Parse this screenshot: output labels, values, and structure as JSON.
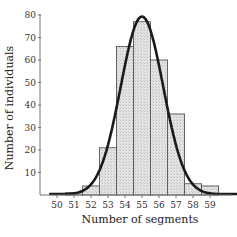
{
  "chart_data": {
    "type": "bar",
    "title": "",
    "xlabel": "Number of segments",
    "ylabel": "Number of individuals",
    "categories": [
      "50",
      "51",
      "52",
      "53",
      "54",
      "55",
      "56",
      "57",
      "58",
      "59"
    ],
    "values": [
      0,
      1,
      4,
      21,
      66,
      77,
      60,
      36,
      5,
      4
    ],
    "ylim": [
      0,
      80
    ],
    "yticks": [
      10,
      20,
      30,
      40,
      50,
      60,
      70,
      80
    ],
    "grid": false,
    "legend": null,
    "overlay": {
      "type": "line",
      "name": "normal fit",
      "mean": 55.0,
      "peak": 79,
      "sd": 1.25
    },
    "colors": {
      "bar_fill": "#dcdcdc",
      "bar_edge": "#555555",
      "curve": "#1a1a1a",
      "axis": "#666666"
    }
  }
}
